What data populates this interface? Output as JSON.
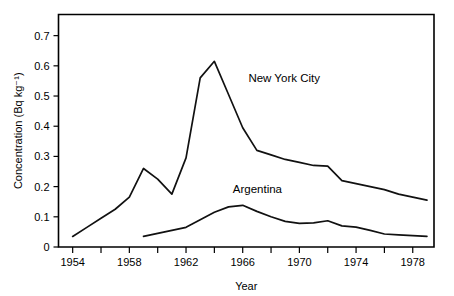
{
  "chart_data": {
    "type": "line",
    "title": "",
    "xlabel": "Year",
    "ylabel": "Concentration (Bq kg⁻¹)",
    "xlim": [
      1953,
      1979.5
    ],
    "ylim": [
      0,
      0.77
    ],
    "grid": false,
    "legend_position": "inline-annotation",
    "x_ticks_major": [
      1954,
      1958,
      1962,
      1966,
      1970,
      1974,
      1978
    ],
    "x_tick_labels": [
      "1954",
      "1958",
      "1962",
      "1966",
      "1970",
      "1974",
      "1978"
    ],
    "x_ticks_minor": [
      1956,
      1960,
      1964,
      1968,
      1972,
      1976
    ],
    "y_ticks": [
      0,
      0.1,
      0.2,
      0.3,
      0.4,
      0.5,
      0.6,
      0.7
    ],
    "y_tick_labels": [
      "0",
      "0.1",
      "0.2",
      "0.3",
      "0.4",
      "0.5",
      "0.6",
      "0.7"
    ],
    "series": [
      {
        "name": "New York City",
        "label_x": 1966.4,
        "label_y": 0.545,
        "x": [
          1954,
          1955,
          1956,
          1957,
          1958,
          1959,
          1960,
          1961,
          1962,
          1963,
          1964,
          1965,
          1966,
          1967,
          1968,
          1969,
          1970,
          1971,
          1972,
          1973,
          1974,
          1975,
          1976,
          1977,
          1978,
          1979
        ],
        "values": [
          0.035,
          0.065,
          0.095,
          0.125,
          0.165,
          0.26,
          0.225,
          0.175,
          0.295,
          0.56,
          0.615,
          0.505,
          0.395,
          0.32,
          0.305,
          0.29,
          0.28,
          0.27,
          0.268,
          0.22,
          0.21,
          0.2,
          0.19,
          0.175,
          0.165,
          0.155
        ]
      },
      {
        "name": "Argentina",
        "label_x": 1965.3,
        "label_y": 0.178,
        "x": [
          1959,
          1960,
          1961,
          1962,
          1963,
          1964,
          1965,
          1966,
          1967,
          1968,
          1969,
          1970,
          1971,
          1972,
          1973,
          1974,
          1975,
          1976,
          1977,
          1978,
          1979
        ],
        "values": [
          0.035,
          0.045,
          0.055,
          0.065,
          0.09,
          0.115,
          0.133,
          0.138,
          0.118,
          0.1,
          0.085,
          0.078,
          0.08,
          0.087,
          0.07,
          0.066,
          0.055,
          0.043,
          0.04,
          0.038,
          0.035
        ]
      }
    ]
  }
}
